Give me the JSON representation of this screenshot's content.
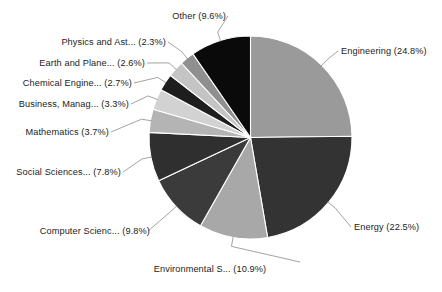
{
  "chart_data": {
    "type": "pie",
    "title": "",
    "subtitle": "",
    "xlabel": "",
    "ylabel": "",
    "legend_position": "none",
    "grid": false,
    "start_angle_deg": 0,
    "direction": "clockwise",
    "categories": [
      "Engineering",
      "Energy",
      "Environmental S...",
      "Computer Scienc...",
      "Social Sciences...",
      "Mathematics",
      "Business, Manag...",
      "Chemical Engine...",
      "Earth and Plane...",
      "Physics and Ast...",
      "Other"
    ],
    "values": [
      24.8,
      22.5,
      10.9,
      9.8,
      7.8,
      3.7,
      3.3,
      2.7,
      2.6,
      2.3,
      9.6
    ],
    "value_unit": "%",
    "colors": [
      "#9a9a9a",
      "#333333",
      "#a8a8a8",
      "#3b3b3b",
      "#2f2f2f",
      "#b4b4b4",
      "#d2d2d2",
      "#1e1e1e",
      "#c4c4c4",
      "#8f8f8f",
      "#0a0a0a"
    ],
    "labels": [
      "Engineering (24.8%)",
      "Energy (22.5%)",
      "Environmental S... (10.9%)",
      "Computer Scienc... (9.8%)",
      "Social Sciences... (7.8%)",
      "Mathematics (3.7%)",
      "Business, Manag... (3.3%)",
      "Chemical Engine... (2.7%)",
      "Earth and Plane... (2.6%)",
      "Physics and Ast... (2.3%)",
      "Other (9.6%)"
    ]
  },
  "style": {
    "background": "#ffffff",
    "label_color": "#1c1c1c",
    "leader_line_color": "#8c8c8c",
    "wedge_edge_color": "#ffffff"
  }
}
